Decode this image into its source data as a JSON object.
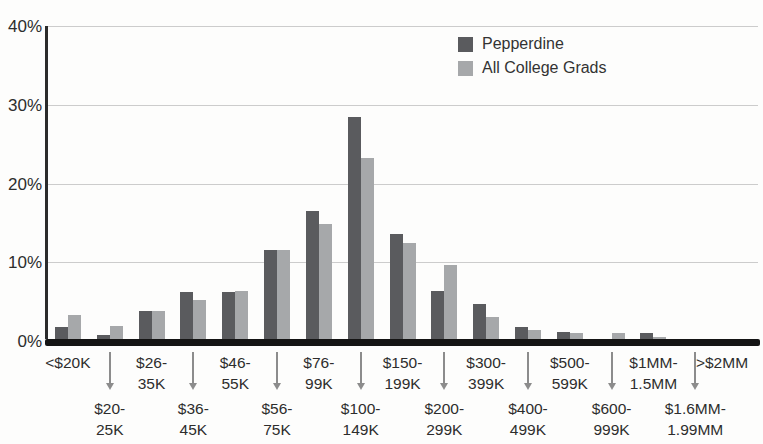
{
  "chart_data": {
    "type": "bar",
    "title": "",
    "xlabel": "",
    "ylabel": "",
    "ylim": [
      0,
      40
    ],
    "grid": true,
    "legend_position": "top-right-inside",
    "yticks": [
      {
        "v": 0,
        "label": "0%"
      },
      {
        "v": 10,
        "label": "10%"
      },
      {
        "v": 20,
        "label": "20%"
      },
      {
        "v": 30,
        "label": "30%"
      },
      {
        "v": 40,
        "label": "40%"
      }
    ],
    "categories": [
      {
        "label": "<$20K",
        "row": 1,
        "lines": "<$20K"
      },
      {
        "label": "$20-25K",
        "row": 2,
        "lines": "$20-\n25K"
      },
      {
        "label": "$26-35K",
        "row": 1,
        "lines": "$26-\n35K"
      },
      {
        "label": "$36-45K",
        "row": 2,
        "lines": "$36-\n45K"
      },
      {
        "label": "$46-55K",
        "row": 1,
        "lines": "$46-\n55K"
      },
      {
        "label": "$56-75K",
        "row": 2,
        "lines": "$56-\n75K"
      },
      {
        "label": "$76-99K",
        "row": 1,
        "lines": "$76-\n99K"
      },
      {
        "label": "$100-149K",
        "row": 2,
        "lines": "$100-\n149K"
      },
      {
        "label": "$150-199K",
        "row": 1,
        "lines": "$150-\n199K"
      },
      {
        "label": "$200-299K",
        "row": 2,
        "lines": "$200-\n299K"
      },
      {
        "label": "$300-399K",
        "row": 1,
        "lines": "$300-\n399K"
      },
      {
        "label": "$400-499K",
        "row": 2,
        "lines": "$400-\n499K"
      },
      {
        "label": "$500-599K",
        "row": 1,
        "lines": "$500-\n599K"
      },
      {
        "label": "$600-999K",
        "row": 2,
        "lines": "$600-\n999K"
      },
      {
        "label": "$1MM-1.5MM",
        "row": 1,
        "lines": "$1MM-\n1.5MM"
      },
      {
        "label": "$1.6MM-1.99MM",
        "row": 2,
        "lines": "$1.6MM-\n1.99MM"
      },
      {
        "label": ">$2MM",
        "row": 1,
        "lines": ">$2MM"
      }
    ],
    "series": [
      {
        "name": "Pepperdine",
        "color": "#5a5b5e",
        "values": [
          1.8,
          0.8,
          3.8,
          6.2,
          6.2,
          11.5,
          16.5,
          28.5,
          13.6,
          6.3,
          4.7,
          1.8,
          1.1,
          0.2,
          1.0,
          0.1,
          0.3
        ]
      },
      {
        "name": "All College Grads",
        "color": "#a6a8aa",
        "values": [
          3.3,
          1.9,
          3.8,
          5.2,
          6.3,
          11.6,
          14.8,
          23.2,
          12.5,
          9.6,
          3.0,
          1.4,
          1.0,
          1.0,
          0.5,
          0.1,
          0.2
        ]
      }
    ]
  },
  "legend": {
    "items": [
      {
        "label": "Pepperdine"
      },
      {
        "label": "All College Grads"
      }
    ]
  }
}
